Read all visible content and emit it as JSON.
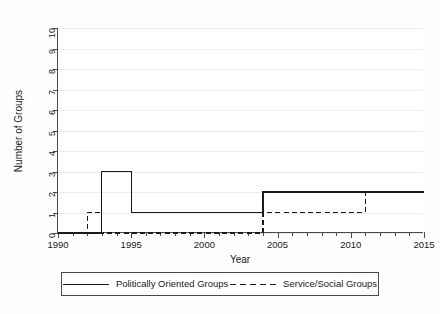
{
  "chart_data": {
    "type": "line",
    "subtype": "step",
    "title": "",
    "xlabel": "Year",
    "ylabel": "Number of Groups",
    "xlim": [
      1990,
      2015
    ],
    "ylim": [
      0,
      10
    ],
    "grid": "horizontal",
    "legend_position": "below",
    "x_ticks_major": [
      1990,
      1995,
      2000,
      2005,
      2010,
      2015
    ],
    "x_tick_labels": [
      "1990",
      "1995",
      "2000",
      "2005",
      "2010",
      "2015"
    ],
    "x_tick_minor_step": 1,
    "y_ticks": [
      0,
      1,
      2,
      3,
      4,
      5,
      6,
      7,
      8,
      9,
      10
    ],
    "y_tick_labels": [
      "0",
      "1",
      "2",
      "3",
      "4",
      "5",
      "6",
      "7",
      "8",
      "9",
      "10"
    ],
    "series": [
      {
        "name": "Politically Oriented Groups",
        "style": "solid",
        "color": "#1a1a1a",
        "x": [
          1990,
          1993,
          1995,
          2004,
          2015
        ],
        "values": [
          0,
          3,
          1,
          2,
          2
        ],
        "steps": [
          {
            "from": 1990,
            "to": 1993,
            "value": 0
          },
          {
            "from": 1993,
            "to": 1995,
            "value": 3
          },
          {
            "from": 1995,
            "to": 2004,
            "value": 1
          },
          {
            "from": 2004,
            "to": 2015,
            "value": 2
          }
        ]
      },
      {
        "name": "Service/Social Groups",
        "style": "dashed",
        "color": "#1a1a1a",
        "x": [
          1990,
          1992,
          1993,
          2004,
          2011,
          2015
        ],
        "values": [
          0,
          1,
          0,
          1,
          2,
          2
        ],
        "steps": [
          {
            "from": 1990,
            "to": 1992,
            "value": 0
          },
          {
            "from": 1992,
            "to": 1993,
            "value": 1
          },
          {
            "from": 1993,
            "to": 2004,
            "value": 0
          },
          {
            "from": 2004,
            "to": 2011,
            "value": 1
          },
          {
            "from": 2011,
            "to": 2015,
            "value": 2
          }
        ]
      }
    ]
  },
  "legend": {
    "entries": [
      {
        "label": "Politically Oriented Groups",
        "style": "solid"
      },
      {
        "label": "Service/Social Groups",
        "style": "dashed"
      }
    ]
  },
  "axis_titles": {
    "x": "Year",
    "y": "Number of Groups"
  },
  "colors": {
    "line": "#1a1a1a",
    "axis": "#4a4a4a",
    "grid": "#ececec",
    "plot_background": "#ffffff",
    "figure_background": "#fdfdfd"
  }
}
